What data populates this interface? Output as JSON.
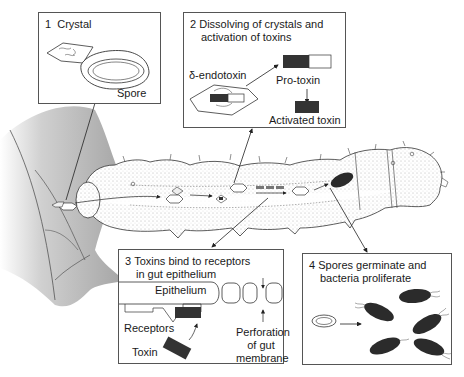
{
  "diagram": {
    "panels": [
      {
        "number": "1",
        "title": "Crystal",
        "labels": {
          "spore": "Spore"
        }
      },
      {
        "number": "2",
        "title_line1": "Dissolving of crystals and",
        "title_line2": "activation of toxins",
        "labels": {
          "endotoxin": "δ-endotoxin",
          "protoxin": "Pro-toxin",
          "activated": "Activated toxin"
        }
      },
      {
        "number": "3",
        "title_line1": "Toxins bind to receptors",
        "title_line2": "in gut epithelium",
        "labels": {
          "epithelium": "Epithelium",
          "receptors": "Receptors",
          "toxin": "Toxin",
          "perforation_line1": "Perforation",
          "perforation_line2": "of gut",
          "perforation_line3": "membrane"
        }
      },
      {
        "number": "4",
        "title_line1": "Spores germinate and",
        "title_line2": "bacteria proliferate"
      }
    ],
    "colors": {
      "line": "#2a2a2a",
      "toxin": "#333333",
      "bacteria": "#2b2b2b",
      "leaf": "#b9b9b9",
      "box_border": "#555555",
      "caterpillar_fill": "#ffffff"
    }
  }
}
